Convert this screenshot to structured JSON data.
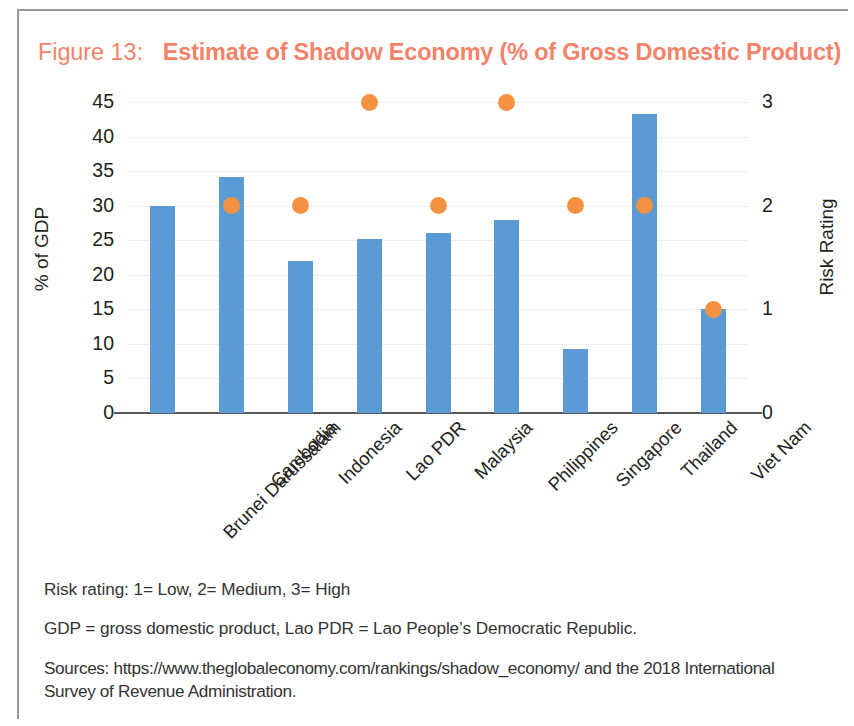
{
  "figure": {
    "number_label": "Figure 13:",
    "title": "Estimate of Shadow Economy (% of Gross Domestic Product)",
    "title_color": "#f2836a"
  },
  "chart_data": {
    "type": "bar",
    "title": "Estimate of Shadow Economy (% of Gross Domestic Product)",
    "xlabel": "",
    "ylabel": "% of GDP",
    "y2label": "Risk Rating",
    "ylim": [
      0,
      45
    ],
    "y2lim": [
      0,
      3
    ],
    "yticks": [
      0,
      5,
      10,
      15,
      20,
      25,
      30,
      35,
      40,
      45
    ],
    "y2ticks": [
      0,
      1,
      2,
      3
    ],
    "grid": true,
    "legend_position": "none",
    "categories": [
      "Brunei Darussalam",
      "Cambodia",
      "Indonesia",
      "Lao PDR",
      "Malaysia",
      "Philippines",
      "Singapore",
      "Thailand",
      "Viet Nam"
    ],
    "series": [
      {
        "name": "% of GDP",
        "type": "bar",
        "axis": "left",
        "color": "#5b9bd5",
        "values": [
          30.0,
          34.2,
          22.0,
          25.2,
          26.0,
          28.0,
          9.2,
          43.3,
          15.0
        ]
      },
      {
        "name": "Risk Rating",
        "type": "scatter",
        "axis": "right",
        "color": "#f59241",
        "values": [
          null,
          2,
          2,
          3,
          2,
          3,
          2,
          2,
          1
        ]
      }
    ]
  },
  "notes": [
    "Risk rating: 1= Low, 2= Medium, 3= High",
    "GDP = gross domestic product, Lao PDR = Lao People’s Democratic Republic.",
    "Sources: https://www.theglobaleconomy.com/rankings/shadow_economy/ and the 2018 International Survey of Revenue Administration."
  ]
}
